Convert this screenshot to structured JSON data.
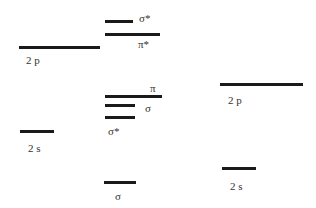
{
  "diagram": {
    "type": "molecular-orbital-energy-diagram",
    "line_color": "#1a1a1a",
    "text_color": "#333333",
    "left_atom": {
      "levels": [
        {
          "id": "left-2p",
          "label": "2 p",
          "x1": 19,
          "x2": 100,
          "y": 46,
          "label_x": 26,
          "label_y": 55
        },
        {
          "id": "left-2s",
          "label": "2 s",
          "x1": 20,
          "x2": 54,
          "y": 130,
          "label_x": 28,
          "label_y": 143
        }
      ]
    },
    "molecule": {
      "levels": [
        {
          "id": "mo-sigma-star-2p",
          "label": "σ*",
          "x1": 105,
          "x2": 133,
          "y": 20,
          "label_x": 139,
          "label_y": 13
        },
        {
          "id": "mo-pi-star-2p",
          "label": "π*",
          "x1": 105,
          "x2": 160,
          "y": 33,
          "label_x": 138,
          "label_y": 39
        },
        {
          "id": "mo-pi-2p",
          "label": "π",
          "x1": 105,
          "x2": 162,
          "y": 95,
          "label_x": 150,
          "label_y": 83
        },
        {
          "id": "mo-sigma-2p",
          "label": "σ",
          "x1": 105,
          "x2": 135,
          "y": 104,
          "label_x": 145,
          "label_y": 103
        },
        {
          "id": "mo-sigma-star-2s",
          "label": "σ*",
          "x1": 105,
          "x2": 135,
          "y": 116,
          "label_x": 108,
          "label_y": 126
        },
        {
          "id": "mo-sigma-2s",
          "label": "σ",
          "x1": 104,
          "x2": 136,
          "y": 181,
          "label_x": 115,
          "label_y": 191
        }
      ]
    },
    "right_atom": {
      "levels": [
        {
          "id": "right-2p",
          "label": "2 p",
          "x1": 220,
          "x2": 303,
          "y": 83,
          "label_x": 228,
          "label_y": 95
        },
        {
          "id": "right-2s",
          "label": "2 s",
          "x1": 222,
          "x2": 256,
          "y": 167,
          "label_x": 230,
          "label_y": 181
        }
      ]
    }
  }
}
